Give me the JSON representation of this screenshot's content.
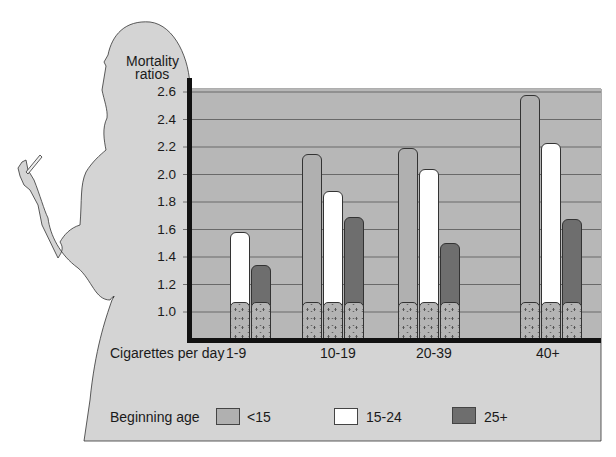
{
  "chart_data": {
    "type": "bar",
    "title": "",
    "ylabel": "Mortality ratios",
    "xlabel": "Cigarettes per day",
    "ylim": [
      0.8,
      2.6
    ],
    "yticks": [
      "2.6",
      "2.4",
      "2.2",
      "2.0",
      "1.8",
      "1.6",
      "1.4",
      "1.2",
      "1.0"
    ],
    "categories": [
      "1-9",
      "10-19",
      "20-39",
      "40+"
    ],
    "legend_title": "Beginning age",
    "series": [
      {
        "name": "<15",
        "color": "#b0b0b0",
        "values": [
          null,
          2.15,
          2.19,
          2.58
        ]
      },
      {
        "name": "15-24",
        "color": "#ffffff",
        "values": [
          1.58,
          1.88,
          2.04,
          2.23
        ]
      },
      {
        "name": "25+",
        "color": "#6e6e6e",
        "values": [
          1.34,
          1.69,
          1.5,
          1.68
        ]
      }
    ],
    "base_value": 1.07,
    "grid": true,
    "legend_position": "bottom"
  },
  "labels": {
    "ylabel_line1": "Mortality",
    "ylabel_line2": "ratios",
    "xlabel": "Cigarettes per day",
    "legend_title": "Beginning age",
    "legend_lt15": "<15",
    "legend_15_24": "15-24",
    "legend_25p": "25+"
  },
  "colors": {
    "panel": "#d4d4d4",
    "plot": "#b7b7b7",
    "light_bar": "#b0b0b0",
    "dark_bar": "#6e6e6e",
    "white_bar": "#ffffff",
    "axis": "#111111"
  }
}
